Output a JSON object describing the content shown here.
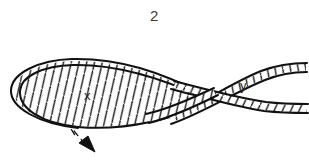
{
  "figure": {
    "caption": "2",
    "background_color": "#ffffff",
    "ink_color": "#111111",
    "width": 309,
    "height": 164,
    "labels": [
      {
        "name": "x",
        "text": "x",
        "description": "region inside the closed loop"
      },
      {
        "name": "y",
        "text": "y",
        "description": "region between the two open strands on the right"
      }
    ],
    "annotation": {
      "arrow_style": "dashed-with-solid-arrowhead",
      "arrow_direction": "down-right",
      "arrow_color": "#111111"
    },
    "rope": {
      "style": "twisted-rope-hatched",
      "stroke_color": "#111111",
      "fill_color": "#ffffff",
      "strand_width": 7
    }
  }
}
